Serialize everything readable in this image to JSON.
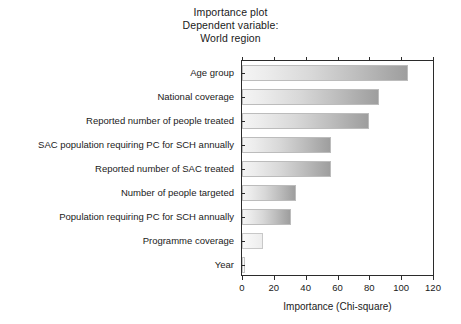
{
  "chart_data": {
    "type": "bar",
    "orientation": "horizontal",
    "title": "Importance plot\nDependent variable:\nWorld region",
    "title_lines": [
      "Importance plot",
      "Dependent variable:",
      "World region"
    ],
    "xlabel": "Importance (Chi-square)",
    "ylabel": "",
    "xlim": [
      0,
      120
    ],
    "xticks": [
      0,
      20,
      40,
      60,
      80,
      100,
      120
    ],
    "xticklabels": [
      "0",
      "20",
      "40",
      "60",
      "80",
      "100",
      "120"
    ],
    "grid": false,
    "legend": null,
    "categories": [
      "Age group",
      "National coverage",
      "Reported number of people treated",
      "SAC population requiring PC for SCH annually",
      "Reported number of SAC treated",
      "Number of people targeted",
      "Population requiring PC for SCH annually",
      "Programme coverage",
      "Year"
    ],
    "values": [
      104,
      86,
      80,
      56,
      56,
      34,
      31,
      13,
      2
    ],
    "bar_style": {
      "fill": "horizontal-gradient",
      "gradient_start": "#f4f4f4",
      "gradient_end": "#9e9e9e",
      "edge": "#bcbcbc"
    },
    "axis_color": "#2b2b2b",
    "background": "#ffffff"
  }
}
